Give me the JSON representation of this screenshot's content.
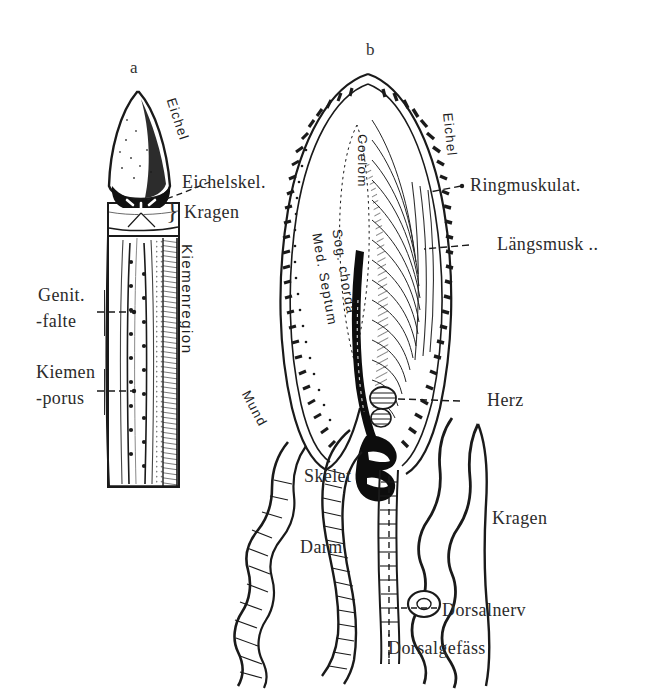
{
  "plate": {
    "title": "Enteropneusta anatomy plate",
    "background_color": "#ffffff",
    "ink_color": "#1a1a1a",
    "width": 652,
    "height": 689
  },
  "figures": [
    {
      "id": "a",
      "letter": "a",
      "caption": "external view of proboscis, collar and branchial region"
    },
    {
      "id": "b",
      "letter": "b",
      "caption": "sagittal section through proboscis and collar"
    }
  ],
  "figure_a_labels": {
    "eichel": "Eichel",
    "eichelskel": "Eichelskel.",
    "kragen": "Kragen",
    "genit_falte_line1": "Genit.",
    "genit_falte_line2": "-falte",
    "kiemen_porus_line1": "Kiemen",
    "kiemen_porus_line2": "-porus",
    "kiemenregion": "Kiemenregion"
  },
  "figure_b_labels": {
    "eichel": "Eichel",
    "coelom": "Coelom",
    "med_septum": "Med. Septum",
    "sog_chorda": "Sog. chorda",
    "ringmuskulat": "Ringmuskulat.",
    "laengsmusk": "Längsmusk ..",
    "herz": "Herz",
    "mund": "Mund",
    "skelet": "Skelet",
    "darm": "Darm",
    "kragen": "Kragen",
    "dorsalnerv": "Dorsalnerv",
    "dorsalgefaess": "Dorsalgefäss"
  }
}
